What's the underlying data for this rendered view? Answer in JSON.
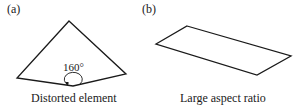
{
  "panels": [
    {
      "tag": "(a)",
      "caption": "Distorted element",
      "angle_label": "160°"
    },
    {
      "tag": "(b)",
      "caption": "Large aspect ratio"
    }
  ],
  "colors": {
    "stroke": "#1a1a1a",
    "background": "#ffffff"
  }
}
